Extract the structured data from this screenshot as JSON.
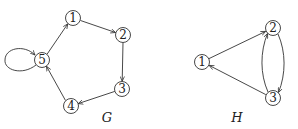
{
  "graphs": [
    {
      "id": "G",
      "label": "G",
      "label_pos": [
        107,
        119
      ],
      "nodes": [
        {
          "id": "1",
          "label": "1",
          "x": 73,
          "y": 18
        },
        {
          "id": "2",
          "label": "2",
          "x": 123,
          "y": 35
        },
        {
          "id": "3",
          "label": "3",
          "x": 122,
          "y": 89
        },
        {
          "id": "4",
          "label": "4",
          "x": 71,
          "y": 106
        },
        {
          "id": "5",
          "label": "5",
          "x": 42,
          "y": 60
        }
      ],
      "edges": [
        {
          "from": "1",
          "to": "2"
        },
        {
          "from": "2",
          "to": "3"
        },
        {
          "from": "3",
          "to": "4"
        },
        {
          "from": "4",
          "to": "5"
        },
        {
          "from": "5",
          "to": "1"
        },
        {
          "from": "5",
          "to": "5",
          "self_loop": true
        }
      ]
    },
    {
      "id": "H",
      "label": "H",
      "label_pos": [
        237,
        119
      ],
      "nodes": [
        {
          "id": "1",
          "label": "1",
          "x": 202,
          "y": 62
        },
        {
          "id": "2",
          "label": "2",
          "x": 273,
          "y": 28
        },
        {
          "id": "3",
          "label": "3",
          "x": 273,
          "y": 98
        }
      ],
      "edges": [
        {
          "from": "1",
          "to": "2"
        },
        {
          "from": "2",
          "to": "3",
          "curve": "right"
        },
        {
          "from": "3",
          "to": "2",
          "curve": "left"
        },
        {
          "from": "3",
          "to": "1"
        }
      ]
    }
  ],
  "style": {
    "stroke": "#333333",
    "node_radius": 7.5
  }
}
